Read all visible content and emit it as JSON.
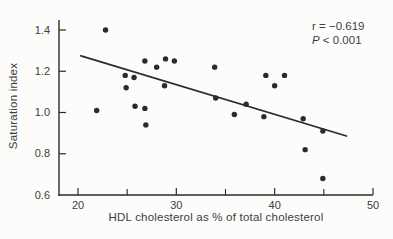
{
  "figure": {
    "background": "#fcfcfb",
    "ink": "#2b2b2b",
    "text_color": "#3d3d3d"
  },
  "axes": {
    "xlabel": "HDL cholesterol as % of total cholesterol",
    "ylabel": "Saturation index"
  },
  "annotation": {
    "line1": "r = −0.619",
    "line2_var": "P",
    "line2_rest": " < 0.001"
  },
  "chart_data": {
    "type": "scatter",
    "title": "",
    "xlabel": "HDL cholesterol as % of total cholesterol",
    "ylabel": "Saturation index",
    "xlim": [
      18,
      50
    ],
    "ylim": [
      0.6,
      1.45
    ],
    "xticks_major": [
      20,
      30,
      40,
      50
    ],
    "xticks_minor": [
      25,
      35,
      45
    ],
    "yticks": [
      0.6,
      0.8,
      1.0,
      1.2,
      1.4
    ],
    "grid": false,
    "legend": "none",
    "marker": "filled-circle",
    "annotation_lines": [
      "r = −0.619",
      "P < 0.001"
    ],
    "stats": {
      "r": -0.619,
      "p": "< 0.001"
    },
    "points": [
      [
        22.8,
        1.4
      ],
      [
        26.8,
        1.25
      ],
      [
        28.0,
        1.22
      ],
      [
        28.9,
        1.26
      ],
      [
        29.8,
        1.25
      ],
      [
        33.9,
        1.22
      ],
      [
        24.8,
        1.18
      ],
      [
        25.7,
        1.17
      ],
      [
        24.9,
        1.12
      ],
      [
        28.8,
        1.13
      ],
      [
        21.9,
        1.01
      ],
      [
        25.8,
        1.03
      ],
      [
        26.8,
        1.02
      ],
      [
        26.9,
        0.94
      ],
      [
        34.0,
        1.07
      ],
      [
        35.9,
        0.99
      ],
      [
        37.1,
        1.04
      ],
      [
        39.1,
        1.18
      ],
      [
        40.0,
        1.13
      ],
      [
        41.0,
        1.18
      ],
      [
        38.9,
        0.98
      ],
      [
        42.9,
        0.97
      ],
      [
        44.9,
        0.91
      ],
      [
        43.1,
        0.82
      ],
      [
        44.9,
        0.68
      ]
    ],
    "trend_line": {
      "x1": 20.3,
      "y1": 1.275,
      "x2": 47.3,
      "y2": 0.886
    }
  }
}
